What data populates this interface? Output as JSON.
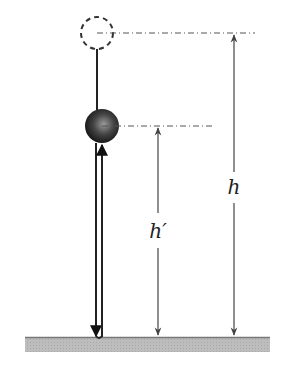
{
  "diagram": {
    "labels": {
      "h": "h",
      "h_prime": "h′"
    },
    "colors": {
      "ground_fill": "#b8b8b8",
      "ground_edge": "#777777",
      "ball_dark": "#1a1a1a",
      "ball_light": "#8a8a8a",
      "line": "#333333",
      "guide": "#555555"
    },
    "geometry": {
      "initial_position": {
        "cx": 97,
        "cy": 33,
        "r": 16,
        "style": "dashed"
      },
      "rebound_position": {
        "cx": 102,
        "cy": 126,
        "r": 17,
        "style": "solid"
      },
      "ground": {
        "x": 25,
        "y": 337,
        "width": 245,
        "height": 15
      },
      "h_dimension": {
        "x": 234,
        "top": 33,
        "bottom": 337
      },
      "h_prime_dimension": {
        "x": 158,
        "top": 126,
        "bottom": 337
      }
    }
  }
}
